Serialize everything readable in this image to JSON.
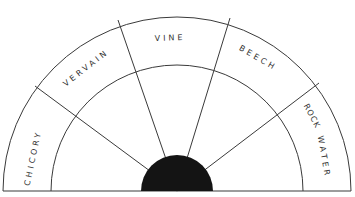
{
  "diagram": {
    "type": "semicircular-wheel",
    "colors": {
      "line": "#3a3a3a",
      "hub": "#141414",
      "text": "#333333",
      "background": "#ffffff"
    },
    "segments": [
      {
        "id": "chicory",
        "label": "CHICORY"
      },
      {
        "id": "vervain",
        "label": "VERVAIN"
      },
      {
        "id": "vine",
        "label": "VINE"
      },
      {
        "id": "beech",
        "label": "BEECH"
      },
      {
        "id": "rock-water",
        "label_line1": "ROCK",
        "label_line2": "WATER"
      }
    ]
  }
}
